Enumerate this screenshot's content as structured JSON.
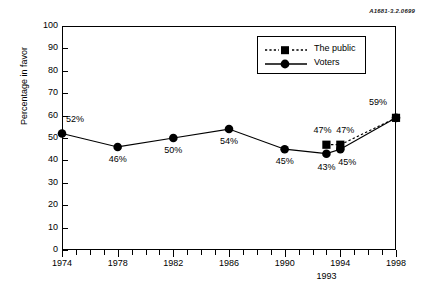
{
  "source_code": "A1681-3.2.0699",
  "chart_data": {
    "type": "line",
    "title": "",
    "xlabel": "",
    "ylabel": "Percentage in favor",
    "ylim": [
      0,
      100
    ],
    "ytick_step": 10,
    "yticks": [
      "0",
      "10",
      "20",
      "30",
      "40",
      "50",
      "60",
      "70",
      "80",
      "90",
      "100"
    ],
    "xlim": [
      1974,
      1998
    ],
    "xticks": [
      "1974",
      "1978",
      "1982",
      "1986",
      "1990",
      "1994",
      "1998"
    ],
    "xtick_extra": "1993",
    "grid": false,
    "legend_position": "top-right-inside",
    "series": [
      {
        "name": "The public",
        "marker": "square",
        "line_style": "dotted",
        "x": [
          1993,
          1994,
          1998
        ],
        "values": [
          47,
          47,
          59
        ],
        "labels": [
          "47%",
          "47%",
          "59%"
        ]
      },
      {
        "name": "Voters",
        "marker": "circle",
        "line_style": "solid",
        "x": [
          1974,
          1978,
          1982,
          1986,
          1990,
          1993,
          1994,
          1998
        ],
        "values": [
          52,
          46,
          50,
          54,
          45,
          43,
          45,
          59
        ],
        "labels": [
          "52%",
          "46%",
          "50%",
          "54%",
          "45%",
          "43%",
          "45%",
          "59%"
        ]
      }
    ],
    "annotations": [
      {
        "text": "52%",
        "value": 52
      },
      {
        "text": "46%",
        "value": 46
      },
      {
        "text": "50%",
        "value": 50
      },
      {
        "text": "54%",
        "value": 54
      },
      {
        "text": "45%",
        "value": 45
      },
      {
        "text": "47%",
        "value": 47
      },
      {
        "text": "43%",
        "value": 43
      },
      {
        "text": "47%",
        "value": 47
      },
      {
        "text": "45%",
        "value": 45
      },
      {
        "text": "59%",
        "value": 59
      }
    ]
  },
  "legend": {
    "items": [
      {
        "label": "The public"
      },
      {
        "label": "Voters"
      }
    ]
  },
  "colors": {
    "ink": "#000000",
    "background": "#ffffff"
  }
}
